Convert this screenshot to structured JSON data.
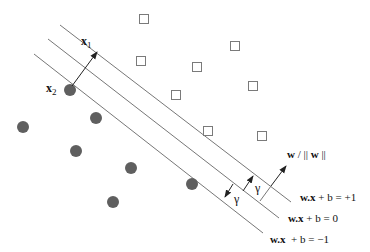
{
  "diagram": {
    "colors": {
      "line": "#777777",
      "circle": "#5f5f5f",
      "square_stroke": "#7a7a7a",
      "arrow": "#222222",
      "text": "#111111"
    },
    "hyperplanes": [
      {
        "name": "plus-margin",
        "label_bold": "w.x",
        "label_rest": " + b = +1",
        "x1": 60,
        "y1": 25,
        "x2": 291,
        "y2": 202,
        "label_x": 300,
        "label_y": 200
      },
      {
        "name": "decision-boundary",
        "label_bold": "w.x",
        "label_rest": " + b = 0",
        "x1": 48,
        "y1": 39,
        "x2": 279,
        "y2": 218,
        "label_x": 288,
        "label_y": 221
      },
      {
        "name": "minus-margin",
        "label_bold": "w.x",
        "label_rest": "  + b = −1",
        "x1": 34,
        "y1": 54,
        "x2": 263,
        "y2": 233,
        "label_x": 270,
        "label_y": 242
      }
    ],
    "class_negative_circles": [
      {
        "cx": 70,
        "cy": 90
      },
      {
        "cx": 96,
        "cy": 118
      },
      {
        "cx": 23,
        "cy": 127
      },
      {
        "cx": 76,
        "cy": 151
      },
      {
        "cx": 131,
        "cy": 168
      },
      {
        "cx": 192,
        "cy": 184
      },
      {
        "cx": 113,
        "cy": 202
      }
    ],
    "class_positive_squares": [
      {
        "cx": 144,
        "cy": 19
      },
      {
        "cx": 141,
        "cy": 61
      },
      {
        "cx": 197,
        "cy": 67
      },
      {
        "cx": 235,
        "cy": 46
      },
      {
        "cx": 176,
        "cy": 95
      },
      {
        "cx": 253,
        "cy": 86
      },
      {
        "cx": 208,
        "cy": 131
      },
      {
        "cx": 262,
        "cy": 136
      }
    ],
    "labels": {
      "x1": {
        "base": "x",
        "sub": "1"
      },
      "x2": {
        "base": "x",
        "sub": "2"
      },
      "normal": {
        "w": "w",
        "rest": " / || ",
        "w2": "w",
        "end": " ||"
      },
      "gamma_upper": "γ",
      "gamma_lower": "γ"
    }
  }
}
